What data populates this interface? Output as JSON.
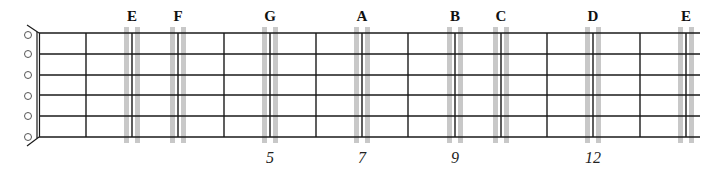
{
  "diagram": {
    "type": "guitar-fretboard",
    "colors": {
      "line": "#1a1a1a",
      "highlight": "#c8c8c8",
      "peg": "#555555",
      "background": "#ffffff"
    },
    "strings": {
      "count": 6,
      "y": [
        33,
        54,
        75,
        95,
        116,
        137
      ],
      "x_start": 39,
      "x_end": 700
    },
    "nut": {
      "x": 37
    },
    "tuning_pegs": {
      "x": 28,
      "y": [
        35,
        54,
        75,
        96,
        116,
        137
      ],
      "radius": 3.5
    },
    "frets": [
      {
        "index": 1,
        "x": 86
      },
      {
        "index": 2,
        "x": 132
      },
      {
        "index": 3,
        "x": 178
      },
      {
        "index": 4,
        "x": 224
      },
      {
        "index": 5,
        "x": 270
      },
      {
        "index": 6,
        "x": 316
      },
      {
        "index": 7,
        "x": 362
      },
      {
        "index": 8,
        "x": 408
      },
      {
        "index": 9,
        "x": 455
      },
      {
        "index": 10,
        "x": 501
      },
      {
        "index": 11,
        "x": 547
      },
      {
        "index": 12,
        "x": 593
      },
      {
        "index": 13,
        "x": 640
      },
      {
        "index": 14,
        "x": 686
      }
    ],
    "highlighted_notes": [
      {
        "label": "E",
        "fret_x": 132
      },
      {
        "label": "F",
        "fret_x": 178
      },
      {
        "label": "G",
        "fret_x": 270
      },
      {
        "label": "A",
        "fret_x": 362
      },
      {
        "label": "B",
        "fret_x": 455
      },
      {
        "label": "C",
        "fret_x": 501
      },
      {
        "label": "D",
        "fret_x": 593
      },
      {
        "label": "E",
        "fret_x": 686
      }
    ],
    "fret_markers": [
      {
        "label": "5",
        "x": 270
      },
      {
        "label": "7",
        "x": 362
      },
      {
        "label": "9",
        "x": 455
      },
      {
        "label": "12",
        "x": 593
      }
    ]
  }
}
